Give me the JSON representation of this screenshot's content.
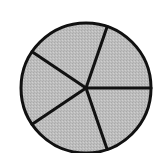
{
  "diagram": {
    "type": "divided-circle",
    "center": [
      86,
      88
    ],
    "radius": 65,
    "fill_color": "#bdbdbd",
    "stroke_color": "#111111",
    "stroke_width": 3,
    "background": "#ffffff",
    "spoke_angles_deg": [
      0,
      71,
      146,
      214,
      289
    ],
    "sectors": [
      {
        "from": 0,
        "to": 71
      },
      {
        "from": 71,
        "to": 146
      },
      {
        "from": 146,
        "to": 214
      },
      {
        "from": 214,
        "to": 289
      },
      {
        "from": 289,
        "to": 360
      }
    ]
  },
  "chart_data": {
    "type": "pie",
    "title": "",
    "labels": [
      "",
      "",
      "",
      "",
      ""
    ],
    "values_deg": [
      71,
      75,
      68,
      75,
      71
    ],
    "slice_count": 5
  }
}
